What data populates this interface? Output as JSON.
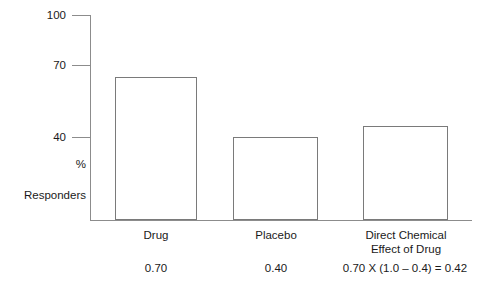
{
  "chart_data": {
    "type": "bar",
    "title": "",
    "xlabel": "",
    "ylabel": "% Responders",
    "ylim": [
      0,
      100
    ],
    "yticks": [
      100,
      70,
      40
    ],
    "ytick_labels": [
      "100",
      "70",
      "40"
    ],
    "grid": false,
    "legend": null,
    "categories": [
      "Drug",
      "Placebo",
      "Direct Chemical Effect of Drug"
    ],
    "values": [
      70,
      40.5,
      46
    ],
    "annotations": [
      "0.70",
      "0.40",
      "0.70 X (1.0 – 0.4) = 0.42"
    ]
  },
  "axis": {
    "tick_100": "100",
    "tick_70": "70",
    "tick_40": "40",
    "caption_percent": "%",
    "caption_responders": "Responders"
  },
  "bars": [
    {
      "name": "drug",
      "label": "Drug",
      "value_label": "0.70",
      "value": 70
    },
    {
      "name": "placebo",
      "label": "Placebo",
      "value_label": "0.40",
      "value": 40.5
    },
    {
      "name": "direct-chemical-effect",
      "label_line1": "Direct Chemical",
      "label_line2": "Effect of Drug",
      "value_label": "0.70 X (1.0 – 0.4) = 0.42",
      "value": 46
    }
  ],
  "colors": {
    "background": "#ffffff",
    "axis": "#8c8c8c",
    "bar_outline": "#7a7a7a",
    "text": "#1a1a1a"
  }
}
